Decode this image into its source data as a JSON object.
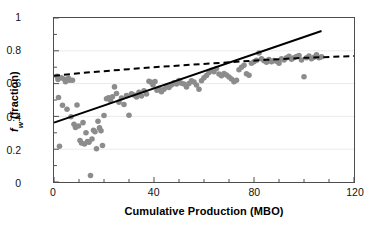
{
  "chart_data": {
    "type": "scatter",
    "title": "",
    "xlabel": "Cumulative Production (MBO)",
    "ylabel_plain": "fw (fraction)",
    "ylabel_symbol": "f",
    "ylabel_subscript": "w",
    "ylabel_suffix": " (fraction)",
    "xlim": [
      0,
      120
    ],
    "ylim": [
      0,
      1
    ],
    "xticks": [
      0,
      40,
      80,
      120
    ],
    "xtick_labels": [
      "0",
      "40",
      "80",
      "120"
    ],
    "x_minor_tick_step": 10,
    "yticks": [
      0,
      0.2,
      0.4,
      0.6,
      0.8,
      1
    ],
    "ytick_labels": [
      "0",
      "0.2",
      "0.4",
      "0.6",
      "0.8",
      "1"
    ],
    "y_minor_tick_step": 0.1,
    "grid": "horizontal-major-only",
    "grid_color": "#ebebeb",
    "axis_color": "#4d4d4d",
    "legend": "none",
    "marker_color": "#8c8c8c",
    "marker_size_px": 5.6,
    "series": [
      {
        "name": "Water cut samples",
        "type": "scatter",
        "color": "#8c8c8c",
        "points": [
          [
            1.2,
            0.645
          ],
          [
            1.6,
            0.625
          ],
          [
            1.8,
            0.515
          ],
          [
            2.2,
            0.218
          ],
          [
            3.0,
            0.635
          ],
          [
            3.4,
            0.468
          ],
          [
            4.2,
            0.627
          ],
          [
            4.6,
            0.612
          ],
          [
            5.2,
            0.443
          ],
          [
            5.8,
            0.632
          ],
          [
            6.3,
            0.62
          ],
          [
            6.8,
            0.398
          ],
          [
            7.4,
            0.621
          ],
          [
            8.0,
            0.352
          ],
          [
            8.6,
            0.332
          ],
          [
            9.2,
            0.47
          ],
          [
            9.8,
            0.342
          ],
          [
            10.4,
            0.253
          ],
          [
            11.0,
            0.238
          ],
          [
            11.6,
            0.362
          ],
          [
            12.2,
            0.232
          ],
          [
            12.8,
            0.3
          ],
          [
            13.4,
            0.247
          ],
          [
            14.0,
            0.243
          ],
          [
            14.6,
            0.04
          ],
          [
            15.2,
            0.262
          ],
          [
            15.8,
            0.316
          ],
          [
            16.4,
            0.307
          ],
          [
            17.0,
            0.203
          ],
          [
            17.6,
            0.37
          ],
          [
            18.2,
            0.33
          ],
          [
            18.8,
            0.313
          ],
          [
            19.4,
            0.222
          ],
          [
            20.0,
            0.405
          ],
          [
            21.0,
            0.508
          ],
          [
            21.8,
            0.513
          ],
          [
            22.6,
            0.497
          ],
          [
            23.4,
            0.52
          ],
          [
            24.2,
            0.58
          ],
          [
            25.0,
            0.54
          ],
          [
            26.0,
            0.487
          ],
          [
            27.0,
            0.512
          ],
          [
            28.0,
            0.472
          ],
          [
            29.0,
            0.527
          ],
          [
            30.0,
            0.407
          ],
          [
            31.0,
            0.538
          ],
          [
            32.0,
            0.53
          ],
          [
            33.0,
            0.519
          ],
          [
            34.0,
            0.547
          ],
          [
            35.0,
            0.525
          ],
          [
            36.0,
            0.556
          ],
          [
            37.0,
            0.537
          ],
          [
            38.0,
            0.614
          ],
          [
            38.8,
            0.608
          ],
          [
            39.6,
            0.592
          ],
          [
            40.4,
            0.613
          ],
          [
            41.2,
            0.56
          ],
          [
            42.0,
            0.572
          ],
          [
            43.0,
            0.551
          ],
          [
            44.0,
            0.566
          ],
          [
            45.0,
            0.583
          ],
          [
            46.0,
            0.576
          ],
          [
            47.0,
            0.592
          ],
          [
            48.0,
            0.605
          ],
          [
            49.0,
            0.597
          ],
          [
            50.0,
            0.619
          ],
          [
            51.0,
            0.602
          ],
          [
            52.0,
            0.598
          ],
          [
            53.0,
            0.58
          ],
          [
            54.0,
            0.601
          ],
          [
            55.0,
            0.617
          ],
          [
            56.0,
            0.609
          ],
          [
            57.0,
            0.592
          ],
          [
            58.0,
            0.565
          ],
          [
            59.0,
            0.618
          ],
          [
            60.0,
            0.635
          ],
          [
            61.0,
            0.65
          ],
          [
            62.0,
            0.667
          ],
          [
            63.0,
            0.681
          ],
          [
            64.0,
            0.672
          ],
          [
            65.0,
            0.692
          ],
          [
            66.0,
            0.659
          ],
          [
            67.0,
            0.648
          ],
          [
            68.0,
            0.661
          ],
          [
            69.0,
            0.652
          ],
          [
            70.0,
            0.64
          ],
          [
            71.0,
            0.628
          ],
          [
            72.0,
            0.612
          ],
          [
            73.0,
            0.62
          ],
          [
            74.0,
            0.684
          ],
          [
            75.0,
            0.7
          ],
          [
            76.0,
            0.712
          ],
          [
            77.0,
            0.66
          ],
          [
            78.0,
            0.651
          ],
          [
            79.0,
            0.724
          ],
          [
            80.0,
            0.733
          ],
          [
            81.0,
            0.742
          ],
          [
            82.0,
            0.787
          ],
          [
            83.0,
            0.751
          ],
          [
            84.0,
            0.739
          ],
          [
            85.0,
            0.73
          ],
          [
            86.0,
            0.747
          ],
          [
            87.0,
            0.733
          ],
          [
            88.0,
            0.741
          ],
          [
            89.0,
            0.736
          ],
          [
            90.0,
            0.724
          ],
          [
            91.0,
            0.752
          ],
          [
            92.0,
            0.744
          ],
          [
            93.0,
            0.758
          ],
          [
            94.0,
            0.766
          ],
          [
            95.0,
            0.748
          ],
          [
            96.0,
            0.757
          ],
          [
            97.0,
            0.765
          ],
          [
            98.0,
            0.772
          ],
          [
            99.0,
            0.744
          ],
          [
            100.0,
            0.642
          ],
          [
            101.0,
            0.758
          ],
          [
            102.0,
            0.768
          ],
          [
            103.0,
            0.752
          ],
          [
            104.0,
            0.761
          ],
          [
            105.0,
            0.776
          ],
          [
            106.0,
            0.757
          ],
          [
            107.0,
            0.763
          ]
        ]
      },
      {
        "name": "Linear trend",
        "type": "line",
        "style": "solid",
        "color": "#000000",
        "width_px": 2,
        "endpoints": [
          [
            0,
            0.362
          ],
          [
            107,
            0.921
          ]
        ]
      },
      {
        "name": "Model curve",
        "type": "line",
        "style": "dashed",
        "color": "#000000",
        "width_px": 2,
        "dash_pattern": "6 4",
        "points": [
          [
            0,
            0.648
          ],
          [
            10,
            0.663
          ],
          [
            20,
            0.676
          ],
          [
            30,
            0.688
          ],
          [
            40,
            0.7
          ],
          [
            55,
            0.715
          ],
          [
            70,
            0.73
          ],
          [
            85,
            0.745
          ],
          [
            100,
            0.757
          ],
          [
            120,
            0.768
          ]
        ]
      }
    ]
  }
}
